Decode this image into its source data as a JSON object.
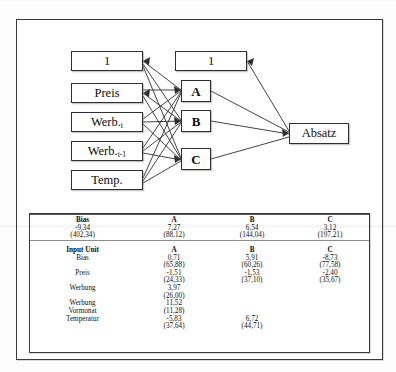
{
  "figure": {
    "diagram": {
      "input_layer": [
        {
          "label": "1",
          "sub": ""
        },
        {
          "label": "Preis",
          "sub": ""
        },
        {
          "label": "Werb.",
          "sub": "t"
        },
        {
          "label": "Werb.",
          "sub": "t-1"
        },
        {
          "label": "Temp.",
          "sub": ""
        }
      ],
      "hidden_bias_label": "1",
      "hidden_layer": [
        "A",
        "B",
        "C"
      ],
      "output_layer": [
        "Absatz"
      ]
    },
    "table": {
      "section1": {
        "header": [
          "Bias",
          "A",
          "B",
          "C"
        ],
        "rows": [
          {
            "label": "",
            "values": [
              "-9,34",
              "7,27",
              "6,54",
              "3,12"
            ]
          },
          {
            "label": "",
            "values": [
              "(402,34)",
              "(88,12)",
              "(144,04)",
              "(197,21)"
            ]
          }
        ]
      },
      "section2": {
        "header": [
          "Input Unit",
          "A",
          "B",
          "C"
        ],
        "rows": [
          {
            "label": "Bias",
            "values": [
              "0,71",
              "5,91",
              "-8,73"
            ]
          },
          {
            "label": "",
            "values": [
              "(65,88)",
              "(60,26)",
              "(77,58)"
            ]
          },
          {
            "label": "Preis",
            "values": [
              "-1,51",
              "-1,53",
              "-2,40"
            ]
          },
          {
            "label": "",
            "values": [
              "(24,33)",
              "(37,10)",
              "(35,67)"
            ]
          },
          {
            "label": "Werbung",
            "values": [
              "3,97",
              "",
              ""
            ]
          },
          {
            "label": "",
            "values": [
              "(26,00)",
              "",
              ""
            ]
          },
          {
            "label": "Werbung",
            "values": [
              "11,52",
              "",
              ""
            ]
          },
          {
            "label": "Vormonat",
            "values": [
              "(11,28)",
              "",
              ""
            ]
          },
          {
            "label": "Temperatur",
            "values": [
              "-5,83",
              "6,72",
              ""
            ]
          },
          {
            "label": "",
            "values": [
              "(37,64)",
              "(44,71)",
              ""
            ]
          }
        ]
      }
    }
  },
  "colors": {
    "line": "#2f2f2f",
    "frame": "#3a3a3a",
    "background": "#ffffff"
  }
}
